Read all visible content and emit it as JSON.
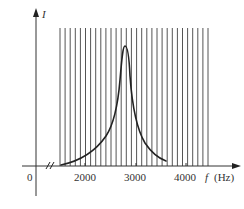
{
  "chart_data": {
    "type": "line",
    "title": "",
    "xlabel": "f (Hz)",
    "ylabel": "I",
    "x_variable": "f",
    "x_unit": "(Hz)",
    "y_variable": "I",
    "origin_label": "0",
    "x_ticks": [
      "2000",
      "3000",
      "4000"
    ],
    "x_tick_values": [
      2000,
      3000,
      4000
    ],
    "axis_break": true,
    "xlim": [
      1500,
      4400
    ],
    "series": [
      {
        "name": "I(f) resonance curve",
        "x": [
          1500,
          1700,
          1900,
          2100,
          2300,
          2450,
          2550,
          2650,
          2700,
          2750,
          2800,
          2850,
          2900,
          2950,
          3000,
          3100,
          3200,
          3300,
          3450
        ],
        "y": [
          0.03,
          0.05,
          0.08,
          0.12,
          0.19,
          0.27,
          0.35,
          0.48,
          0.6,
          0.78,
          1.0,
          0.85,
          0.62,
          0.45,
          0.34,
          0.22,
          0.15,
          0.1,
          0.04
        ]
      }
    ],
    "resonant_frequency_approx": 2800,
    "vertical_grid": {
      "x_start": 1550,
      "x_end": 4470,
      "count": 30
    },
    "grid": false,
    "legend": null
  },
  "labels": {
    "y_axis": "I",
    "x_axis_var": "f",
    "x_axis_unit": "(Hz)",
    "origin": "0",
    "tick_2000": "2000",
    "tick_3000": "3000",
    "tick_4000": "4000"
  }
}
